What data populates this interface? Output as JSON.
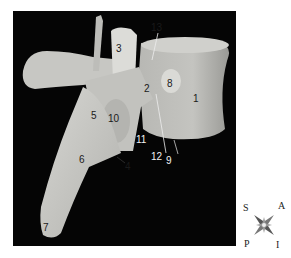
{
  "figure": {
    "background_color": "#050505",
    "bone_color": "#c9c9c5",
    "labels": [
      {
        "id": "1",
        "text": "1",
        "x": 180,
        "y": 83,
        "style": "dark"
      },
      {
        "id": "2",
        "text": "2",
        "x": 131,
        "y": 73,
        "style": "dark"
      },
      {
        "id": "3",
        "text": "3",
        "x": 103,
        "y": 33,
        "style": "dark"
      },
      {
        "id": "4",
        "text": "4",
        "x": 112,
        "y": 151,
        "style": "dark"
      },
      {
        "id": "5",
        "text": "5",
        "x": 78,
        "y": 100,
        "style": "dark"
      },
      {
        "id": "6",
        "text": "6",
        "x": 66,
        "y": 144,
        "style": "dark"
      },
      {
        "id": "7",
        "text": "7",
        "x": 30,
        "y": 212,
        "style": "dark"
      },
      {
        "id": "8",
        "text": "8",
        "x": 154,
        "y": 68,
        "style": "dark"
      },
      {
        "id": "9",
        "text": "9",
        "x": 153,
        "y": 145,
        "style": "light"
      },
      {
        "id": "10",
        "text": "10",
        "x": 95,
        "y": 103,
        "style": "dark"
      },
      {
        "id": "11",
        "text": "11",
        "x": 123,
        "y": 124,
        "style": "light"
      },
      {
        "id": "12",
        "text": "12",
        "x": 138,
        "y": 141,
        "style": "light"
      },
      {
        "id": "13",
        "text": "13",
        "x": 138,
        "y": 12,
        "style": "dark"
      }
    ]
  },
  "compass": {
    "top_left": "S",
    "top_right": "A",
    "bottom_left": "P",
    "bottom_right": "I"
  }
}
